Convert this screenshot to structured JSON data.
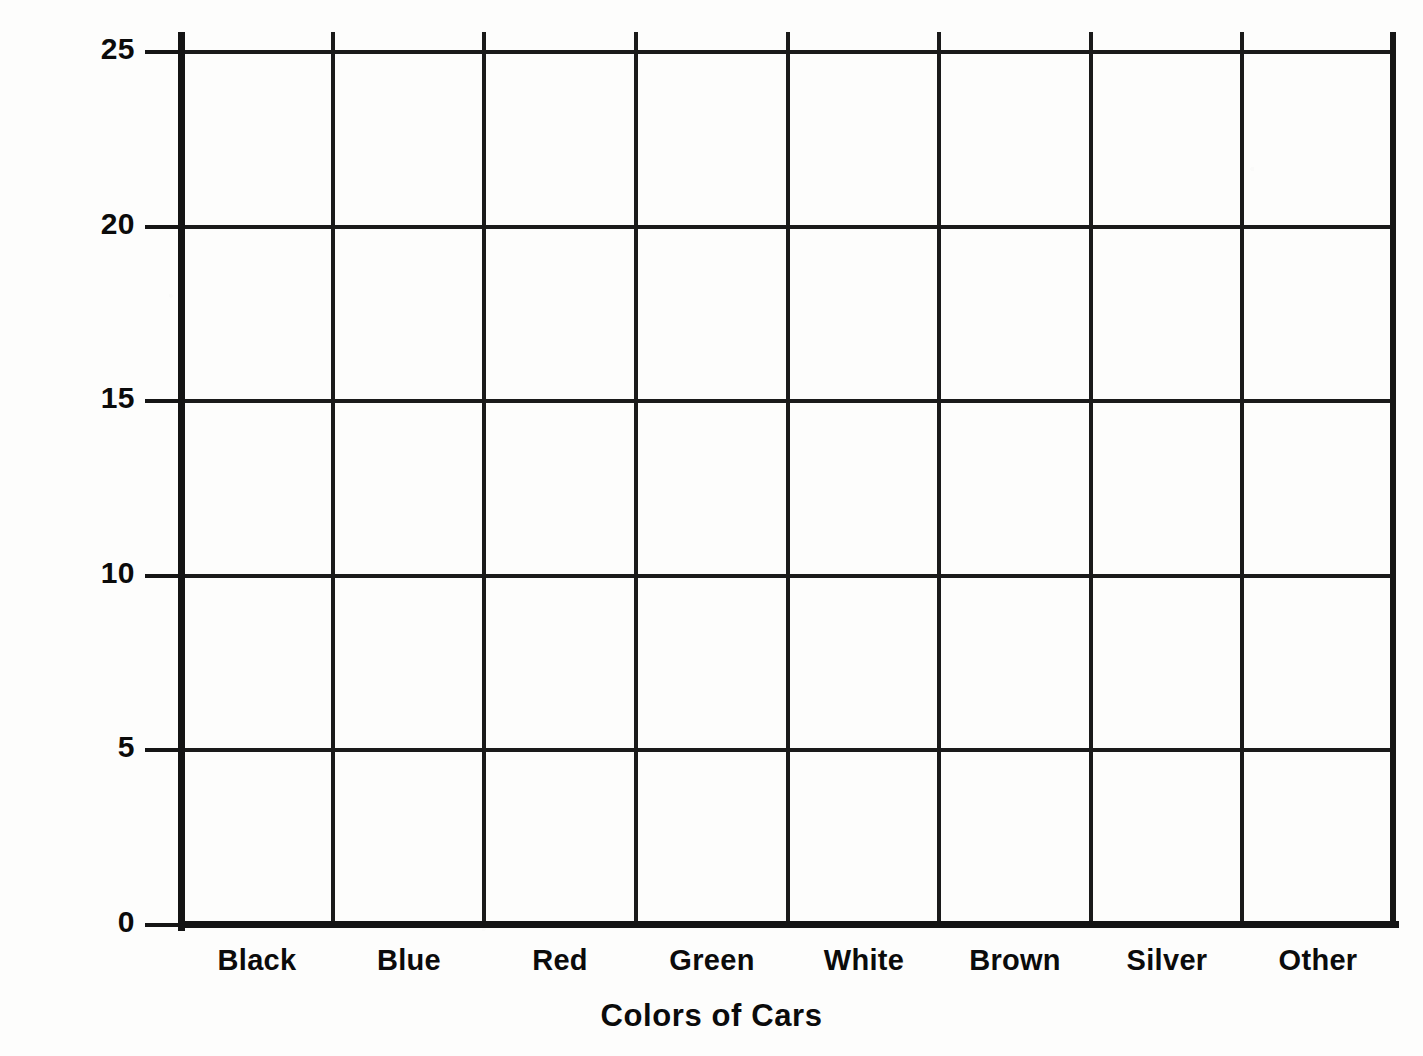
{
  "chart_data": {
    "type": "bar",
    "title": "",
    "xlabel": "Colors of Cars",
    "ylabel": "Number of Cars",
    "categories": [
      "Black",
      "Blue",
      "Red",
      "Green",
      "White",
      "Brown",
      "Silver",
      "Other"
    ],
    "values": [
      null,
      null,
      null,
      null,
      null,
      null,
      null,
      null
    ],
    "yticks": [
      "0",
      "5",
      "10",
      "15",
      "20",
      "25"
    ],
    "ytick_values": [
      0,
      5,
      10,
      15,
      20,
      25
    ],
    "ylim": [
      0,
      25
    ],
    "grid": "both",
    "legend": "none",
    "note": "Blank grid template — no bars plotted; all category values empty."
  },
  "axes": {
    "y_title": "Number of Cars",
    "x_title": "Colors of Cars",
    "y_ticks": [
      {
        "label": "25",
        "value": 25
      },
      {
        "label": "20",
        "value": 20
      },
      {
        "label": "15",
        "value": 15
      },
      {
        "label": "10",
        "value": 10
      },
      {
        "label": "5",
        "value": 5
      },
      {
        "label": "0",
        "value": 0
      }
    ],
    "x_categories": [
      {
        "label": "Black"
      },
      {
        "label": "Blue"
      },
      {
        "label": "Red"
      },
      {
        "label": "Green"
      },
      {
        "label": "White"
      },
      {
        "label": "Brown"
      },
      {
        "label": "Silver"
      },
      {
        "label": "Other"
      }
    ]
  },
  "style": {
    "ink_color": "#141414",
    "paper_color": "#fdfdfc"
  }
}
